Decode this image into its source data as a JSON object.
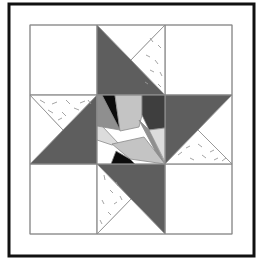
{
  "colors": {
    "background": "#ffffff",
    "frame": "#111111",
    "grid_line": "#8a8a8a",
    "white": "#ffffff",
    "dark": "#5e5e5e",
    "medium": "#8f8f8f",
    "light": "#c4c4c4",
    "lighter": "#dcdcdc",
    "black": "#0c0c0c",
    "charcoal": "#3e3e3e",
    "speckle": "#9a9a9a"
  },
  "frame": {
    "x": 9,
    "y": 4,
    "w": 245,
    "h": 252,
    "stroke_width": 3
  },
  "grid": {
    "x": [
      30,
      97,
      165,
      232
    ],
    "y": [
      25,
      95,
      164,
      234
    ]
  },
  "pieces": [
    {
      "name": "corner-top-left",
      "fill": "white",
      "pts": "30,25 97,25 97,95 30,95"
    },
    {
      "name": "corner-top-right",
      "fill": "white",
      "pts": "165,25 232,25 232,95 165,95"
    },
    {
      "name": "corner-bottom-left",
      "fill": "white",
      "pts": "30,164 97,164 97,234 30,234"
    },
    {
      "name": "corner-bottom-right",
      "fill": "white",
      "pts": "165,164 232,164 232,234 165,234"
    },
    {
      "name": "top-star-point",
      "fill": "dark",
      "pts": "97,25 165,95 97,95"
    },
    {
      "name": "top-white",
      "fill": "white",
      "pts": "97,25 165,25 131,60"
    },
    {
      "name": "top-speckled",
      "fill": "white",
      "speckled": true,
      "pts": "165,25 165,95 131,60"
    },
    {
      "name": "left-star-point",
      "fill": "dark",
      "pts": "30,164 97,95 97,164"
    },
    {
      "name": "left-white",
      "fill": "white",
      "pts": "30,95 30,164 63,130"
    },
    {
      "name": "left-speckled",
      "fill": "white",
      "speckled": true,
      "pts": "30,95 97,95 63,130"
    },
    {
      "name": "right-star-point",
      "fill": "dark",
      "pts": "165,95 232,95 165,164"
    },
    {
      "name": "right-white",
      "fill": "white",
      "pts": "232,95 232,164 198,130"
    },
    {
      "name": "right-speckled",
      "fill": "white",
      "speckled": true,
      "pts": "165,164 232,164 198,130"
    },
    {
      "name": "bottom-star-point",
      "fill": "dark",
      "pts": "97,164 165,164 165,234"
    },
    {
      "name": "bottom-white",
      "fill": "white",
      "pts": "97,234 165,234 131,199"
    },
    {
      "name": "bottom-speckled",
      "fill": "white",
      "speckled": true,
      "pts": "97,164 97,234 131,199"
    },
    {
      "name": "center-base",
      "fill": "white",
      "pts": "97,95 165,95 165,164 97,164"
    },
    {
      "name": "center-left-wedge",
      "fill": "medium",
      "pts": "97,95 102,95 120,130 97,126"
    },
    {
      "name": "center-black-top",
      "fill": "black",
      "pts": "102,95 115,95 120,130"
    },
    {
      "name": "center-light-top",
      "fill": "light",
      "pts": "115,95 142,95 142,115 139,127 120,131"
    },
    {
      "name": "center-charcoal-top-right",
      "fill": "charcoal",
      "pts": "142,95 165,95 165,128 149,130 142,115"
    },
    {
      "name": "center-medium-strip",
      "fill": "medium",
      "pts": "139,120 149,130 165,164 160,160"
    },
    {
      "name": "center-right-light",
      "fill": "lighter",
      "pts": "149,130 165,128 165,162"
    },
    {
      "name": "center-left-lower-light",
      "fill": "lighter",
      "pts": "97,126 103,127 118,143 112,145 97,140"
    },
    {
      "name": "center-lower-light",
      "fill": "light",
      "pts": "112,144 144,137 165,164 130,159"
    },
    {
      "name": "center-black-bottom",
      "fill": "black",
      "pts": "116,151 130,159 135,164 111,164"
    }
  ],
  "speckles": [
    [
      40,
      100,
      45,
      103
    ],
    [
      52,
      104,
      57,
      102
    ],
    [
      66,
      100,
      70,
      104
    ],
    [
      80,
      103,
      85,
      101
    ],
    [
      48,
      110,
      53,
      113
    ],
    [
      62,
      112,
      66,
      116
    ],
    [
      74,
      108,
      79,
      110
    ],
    [
      58,
      120,
      62,
      118
    ],
    [
      88,
      100,
      91,
      104
    ],
    [
      150,
      38,
      153,
      42
    ],
    [
      158,
      45,
      161,
      48
    ],
    [
      146,
      55,
      150,
      57
    ],
    [
      155,
      60,
      158,
      64
    ],
    [
      160,
      72,
      162,
      76
    ],
    [
      150,
      70,
      154,
      72
    ],
    [
      158,
      84,
      161,
      87
    ],
    [
      145,
      82,
      148,
      84
    ],
    [
      178,
      155,
      182,
      152
    ],
    [
      190,
      158,
      194,
      160
    ],
    [
      202,
      155,
      206,
      158
    ],
    [
      214,
      160,
      218,
      158
    ],
    [
      186,
      148,
      190,
      146
    ],
    [
      198,
      144,
      202,
      147
    ],
    [
      210,
      152,
      214,
      150
    ],
    [
      222,
      161,
      226,
      158
    ],
    [
      104,
      175,
      105,
      180
    ],
    [
      110,
      190,
      113,
      193
    ],
    [
      102,
      200,
      104,
      204
    ],
    [
      116,
      182,
      118,
      186
    ],
    [
      108,
      212,
      111,
      215
    ],
    [
      120,
      196,
      122,
      200
    ],
    [
      100,
      220,
      102,
      224
    ],
    [
      114,
      204,
      117,
      202
    ]
  ]
}
